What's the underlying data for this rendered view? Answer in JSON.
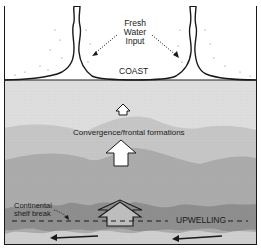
{
  "diagram": {
    "type": "coastal-ocean-schematic",
    "labels": {
      "fresh_water_line1": "Fresh",
      "fresh_water_line2": "Water",
      "fresh_water_line3": "Input",
      "coast": "COAST",
      "convergence": "Convergence/frontal formations",
      "shelf_line1": "Continental",
      "shelf_line2": "shelf break",
      "upwelling": "UPWELLING"
    },
    "colors": {
      "land": "#ffffff",
      "nearshore": "#dcdcdc",
      "mid_shelf": "#c4c4c4",
      "outer_shelf": "#a9a9a9",
      "shelf_break_band": "#8f8f8f",
      "offshore": "#c8c8c8",
      "outline": "#1a1a1a"
    },
    "arrows": [
      {
        "name": "small-up-arrow",
        "direction": "up"
      },
      {
        "name": "medium-up-arrow",
        "direction": "up"
      },
      {
        "name": "large-up-arrow",
        "direction": "up"
      },
      {
        "name": "current-arrow-left",
        "direction": "left"
      },
      {
        "name": "current-arrow-right",
        "direction": "left"
      }
    ]
  }
}
